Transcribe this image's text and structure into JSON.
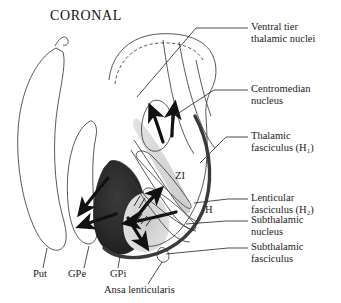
{
  "figure": {
    "title": "CORONAL",
    "background_color": "#ffffff",
    "ink_color": "#1a1a1a"
  },
  "right_labels": [
    {
      "line1": "Ventral tier",
      "line2": "thalamic nuclei"
    },
    {
      "line1": "Centromedian",
      "line2": "nucleus"
    },
    {
      "line1": "Thalamic",
      "line2": "fasciculus (H₁)"
    },
    {
      "line1": "Lenticular",
      "line2": "fasciculus (H₂)"
    },
    {
      "line1": "Subthalamic",
      "line2": "nucleus"
    },
    {
      "line1": "Subthalamic",
      "line2": "fasciculus"
    }
  ],
  "bottom_labels": [
    {
      "text": "Put"
    },
    {
      "text": "GPe"
    },
    {
      "text": "GPi"
    },
    {
      "text": "Ansa lenticularis"
    }
  ],
  "inner_labels": [
    {
      "text": "ZI"
    },
    {
      "text": "H"
    }
  ]
}
